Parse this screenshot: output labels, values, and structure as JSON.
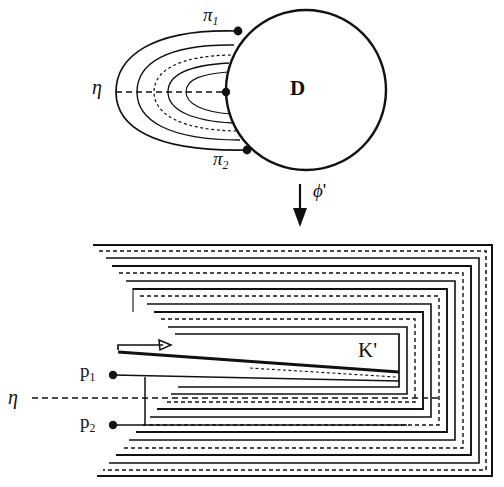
{
  "figure": {
    "background": "#ffffff",
    "stroke": "#111111",
    "width": 504,
    "height": 487
  },
  "top_panel": {
    "name": "disk-panel",
    "disk_label": "D",
    "boundary_points": [
      {
        "id": "pi1",
        "label": "π",
        "subscript": "1",
        "x": 238,
        "y": 31
      },
      {
        "id": "pi2",
        "label": "π",
        "subscript": "2",
        "x": 247,
        "y": 150
      },
      {
        "id": "eta-intersection",
        "label": "",
        "subscript": "",
        "x": 226,
        "y": 92
      }
    ],
    "axis_label": "η",
    "axis_style": "dashed",
    "leaf_count": 5,
    "circle": {
      "cx": 306,
      "cy": 90,
      "r": 80
    }
  },
  "map_arrow": {
    "name": "phi-prime-arrow",
    "label": "ϕ",
    "prime": "'",
    "direction": "down",
    "x": 300,
    "y_start": 184,
    "y_end": 226
  },
  "bottom_panel": {
    "name": "spiral-panel",
    "region_label": "K",
    "region_prime": "'",
    "axis_label": "η",
    "axis_style": "dashed",
    "endpoints": [
      {
        "id": "p1",
        "label": "p",
        "subscript": "1",
        "x": 113,
        "y": 375
      },
      {
        "id": "p2",
        "label": "p",
        "subscript": "2",
        "x": 113,
        "y": 425
      }
    ],
    "flow_arrow": {
      "direction": "right",
      "x": 118,
      "y": 357,
      "length": 48
    },
    "turn_count": 4,
    "line_styles": [
      "solid",
      "dashed"
    ]
  },
  "colors": {
    "ink": "#111111",
    "paper": "#ffffff"
  },
  "glyphs": {
    "pi": "π",
    "eta": "η",
    "phi": "ϕ"
  }
}
